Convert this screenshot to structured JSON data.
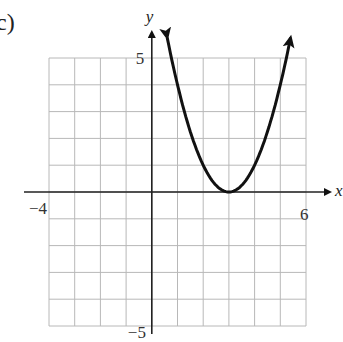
{
  "figure": {
    "part_label": "c)",
    "x_axis_label": "x",
    "y_axis_label": "y",
    "tick_labels": {
      "x_min": "−4",
      "x_max": "6",
      "y_max": "5",
      "y_min": "−5"
    },
    "colors": {
      "grid": "#b8b8b8",
      "axis": "#222222",
      "curve": "#111111",
      "background": "#ffffff"
    }
  },
  "chart_data": {
    "type": "line",
    "title": "",
    "xlabel": "x",
    "ylabel": "y",
    "xlim": [
      -4,
      6
    ],
    "ylim": [
      -5,
      5
    ],
    "grid": true,
    "grid_step": 1,
    "legend": null,
    "annotations": [
      "c)"
    ],
    "series": [
      {
        "name": "parabola y = (x - 3)^2",
        "equation": "y = (x - 3)^2",
        "vertex": [
          3,
          0
        ],
        "arrows_both_ends": true,
        "x": [
          0.6,
          1,
          1.5,
          2,
          2.5,
          3,
          3.5,
          4,
          4.5,
          5,
          5.4
        ],
        "y": [
          5.76,
          4,
          2.25,
          1,
          0.25,
          0,
          0.25,
          1,
          2.25,
          4,
          5.76
        ]
      }
    ]
  }
}
